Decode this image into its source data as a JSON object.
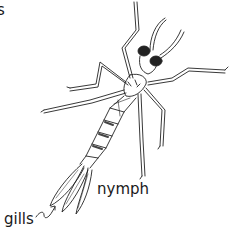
{
  "image": {
    "subject": "damselfly nymph line illustration",
    "labels": {
      "partial_top_left": "s",
      "nymph": "nymph",
      "gills": "gills"
    },
    "colors": {
      "background": "#ffffff",
      "ink": "#1a1a1a"
    }
  }
}
